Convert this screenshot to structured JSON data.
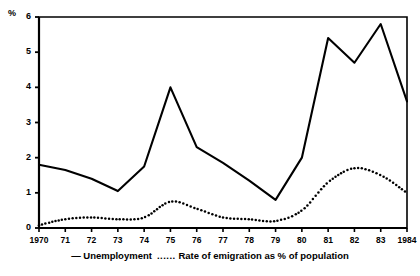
{
  "chart_data": {
    "type": "line",
    "title": "",
    "subtitle": "",
    "xlabel": "",
    "ylabel": "%",
    "ylim": [
      0,
      6
    ],
    "xlim": [
      1970,
      1984
    ],
    "grid": false,
    "legend_position": "bottom",
    "yticks": [
      "0",
      "1",
      "2",
      "3",
      "4",
      "5",
      "6"
    ],
    "ytick_values": [
      0,
      1,
      2,
      3,
      4,
      5,
      6
    ],
    "categories": [
      1970,
      1971,
      1972,
      1973,
      1974,
      1975,
      1976,
      1977,
      1978,
      1979,
      1980,
      1981,
      1982,
      1983,
      1984
    ],
    "xtick_labels": [
      "1970",
      "71",
      "72",
      "73",
      "74",
      "75",
      "76",
      "77",
      "78",
      "79",
      "80",
      "81",
      "82",
      "83",
      "1984"
    ],
    "series": [
      {
        "name": "Unemployment",
        "style": "solid",
        "color": "#000000",
        "values": [
          1.8,
          1.65,
          1.4,
          1.05,
          1.75,
          4.0,
          2.3,
          1.85,
          1.35,
          0.8,
          2.0,
          5.4,
          4.7,
          5.8,
          3.6
        ]
      },
      {
        "name": "Rate of emigration as % of population",
        "style": "dotted",
        "color": "#000000",
        "values": [
          0.08,
          0.25,
          0.3,
          0.25,
          0.3,
          0.75,
          0.55,
          0.3,
          0.25,
          0.2,
          0.5,
          1.3,
          1.7,
          1.5,
          1.0
        ]
      }
    ]
  },
  "legend": {
    "solid_marker": "—",
    "unemployment_label": "Unemployment",
    "dotted_marker": "......",
    "emigration_label": "Rate of emigration as % of population"
  }
}
